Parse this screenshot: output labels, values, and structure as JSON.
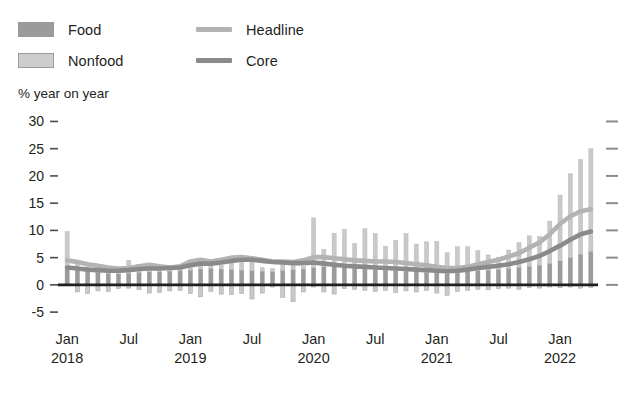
{
  "legend": {
    "items": [
      {
        "name": "food",
        "label": "Food",
        "type": "swatch",
        "color": "#9b9b9b"
      },
      {
        "name": "nonfood",
        "label": "Nonfood",
        "type": "swatch",
        "color": "#c9c9c9"
      },
      {
        "name": "headline",
        "label": "Headline",
        "type": "line",
        "color": "#b3b3b3"
      },
      {
        "name": "core",
        "label": "Core",
        "type": "line",
        "color": "#8a8a8a"
      }
    ]
  },
  "axis_title": "% year on year",
  "chart_data": {
    "type": "bar",
    "title": "",
    "subtitle": "",
    "xlabel": "",
    "ylabel": "% year on year",
    "ylim": [
      -7,
      31
    ],
    "yticks": [
      -5,
      0,
      5,
      10,
      15,
      20,
      25,
      30
    ],
    "ytick_labels": [
      "-5",
      "0",
      "5",
      "10",
      "15",
      "20",
      "25",
      "30"
    ],
    "right_axis_ticks": [
      0,
      5,
      10,
      15,
      20,
      25,
      30
    ],
    "grid": false,
    "legend_position": "top-left",
    "stacked": true,
    "zero_line": true,
    "x": [
      "Jan 2018",
      "Feb 2018",
      "Mar 2018",
      "Apr 2018",
      "May 2018",
      "Jun 2018",
      "Jul 2018",
      "Aug 2018",
      "Sep 2018",
      "Oct 2018",
      "Nov 2018",
      "Dec 2018",
      "Jan 2019",
      "Feb 2019",
      "Mar 2019",
      "Apr 2019",
      "May 2019",
      "Jun 2019",
      "Jul 2019",
      "Aug 2019",
      "Sep 2019",
      "Oct 2019",
      "Nov 2019",
      "Dec 2019",
      "Jan 2020",
      "Feb 2020",
      "Mar 2020",
      "Apr 2020",
      "May 2020",
      "Jun 2020",
      "Jul 2020",
      "Aug 2020",
      "Sep 2020",
      "Oct 2020",
      "Nov 2020",
      "Dec 2020",
      "Jan 2021",
      "Feb 2021",
      "Mar 2021",
      "Apr 2021",
      "May 2021",
      "Jun 2021",
      "Jul 2021",
      "Aug 2021",
      "Sep 2021",
      "Oct 2021",
      "Nov 2021",
      "Dec 2021",
      "Jan 2022",
      "Feb 2022",
      "Mar 2022",
      "Apr 2022"
    ],
    "xtick_labels": [
      {
        "label": "Jan",
        "year": "2018",
        "index": 0
      },
      {
        "label": "Jul",
        "year": "",
        "index": 6
      },
      {
        "label": "Jan",
        "year": "2019",
        "index": 12
      },
      {
        "label": "Jul",
        "year": "",
        "index": 18
      },
      {
        "label": "Jan",
        "year": "2020",
        "index": 24
      },
      {
        "label": "Jul",
        "year": "",
        "index": 30
      },
      {
        "label": "Jan",
        "year": "2021",
        "index": 36
      },
      {
        "label": "Jul",
        "year": "",
        "index": 42
      },
      {
        "label": "Jan",
        "year": "2022",
        "index": 48
      }
    ],
    "series": [
      {
        "name": "Food",
        "kind": "bar",
        "color": "#9b9b9b",
        "values": [
          3.2,
          2.6,
          2.4,
          2.3,
          2.1,
          2.0,
          2.1,
          2.3,
          2.4,
          2.4,
          2.5,
          2.6,
          2.7,
          2.9,
          3.0,
          2.9,
          2.8,
          2.7,
          2.6,
          2.5,
          2.4,
          2.6,
          2.8,
          2.9,
          3.1,
          3.3,
          3.3,
          3.2,
          3.0,
          2.9,
          2.8,
          2.7,
          2.6,
          2.5,
          2.4,
          2.3,
          2.2,
          2.1,
          2.2,
          2.4,
          2.6,
          2.7,
          2.8,
          3.0,
          3.2,
          3.4,
          3.6,
          3.9,
          4.4,
          5.0,
          5.6,
          6.1
        ]
      },
      {
        "name": "Nonfood",
        "kind": "bar",
        "color": "#c9c9c9",
        "values": [
          6.6,
          1.2,
          0.9,
          1.2,
          1.0,
          0.6,
          2.4,
          1.4,
          0.5,
          0.6,
          0.9,
          0.7,
          1.3,
          1.6,
          0.6,
          0.7,
          1.7,
          2.0,
          1.6,
          0.7,
          0.6,
          1.5,
          1.3,
          0.5,
          9.2,
          3.2,
          6.2,
          7.0,
          4.6,
          7.4,
          6.6,
          4.4,
          5.6,
          6.9,
          5.1,
          5.6,
          5.8,
          3.8,
          4.8,
          4.6,
          3.7,
          2.8,
          2.3,
          3.4,
          4.6,
          5.6,
          5.3,
          7.8,
          12.1,
          15.4,
          17.4,
          18.9
        ]
      },
      {
        "name": "Food (negative)",
        "kind": "bar-negative",
        "color": "#c9c9c9",
        "values": [
          0,
          -1.3,
          -1.6,
          -1.1,
          -1.2,
          -0.7,
          -0.6,
          -0.9,
          -1.5,
          -1.4,
          -1.1,
          -1.0,
          -1.6,
          -2.2,
          -1.2,
          -1.7,
          -1.8,
          -1.6,
          -2.6,
          -1.5,
          -0.4,
          -2.3,
          -3.1,
          -1.3,
          -0.4,
          -1.3,
          -1.7,
          -0.7,
          -0.8,
          -1.0,
          -1.2,
          -1.0,
          -1.4,
          -1.1,
          -1.3,
          -1.0,
          -1.5,
          -1.9,
          -1.2,
          -1.0,
          -0.8,
          -0.9,
          -0.7,
          -0.6,
          -0.8,
          -0.5,
          -0.6,
          -0.4,
          -0.5,
          -0.4,
          -0.6,
          -0.5
        ]
      },
      {
        "name": "Headline",
        "kind": "line",
        "color": "#b3b3b3",
        "values": [
          4.5,
          4.2,
          3.8,
          3.5,
          3.2,
          3.0,
          3.1,
          3.4,
          3.7,
          3.4,
          3.2,
          3.4,
          4.3,
          4.6,
          4.3,
          4.6,
          5.0,
          5.1,
          4.9,
          4.6,
          4.3,
          4.3,
          4.2,
          4.5,
          5.1,
          5.1,
          4.9,
          4.7,
          4.5,
          4.4,
          4.3,
          4.3,
          4.2,
          4.0,
          3.8,
          3.6,
          3.3,
          3.1,
          3.1,
          3.3,
          3.8,
          4.2,
          4.6,
          5.2,
          5.8,
          6.8,
          7.8,
          9.3,
          11.2,
          12.6,
          13.5,
          13.9
        ]
      },
      {
        "name": "Core",
        "kind": "line",
        "color": "#8a8a8a",
        "values": [
          3.2,
          3.0,
          2.8,
          2.7,
          2.6,
          2.6,
          2.7,
          2.9,
          3.0,
          3.0,
          3.1,
          3.2,
          3.6,
          3.9,
          3.9,
          4.1,
          4.4,
          4.6,
          4.6,
          4.4,
          4.2,
          4.1,
          4.0,
          4.0,
          4.1,
          3.9,
          3.7,
          3.5,
          3.4,
          3.3,
          3.2,
          3.1,
          3.0,
          2.9,
          2.8,
          2.7,
          2.6,
          2.5,
          2.6,
          2.8,
          3.1,
          3.3,
          3.5,
          3.8,
          4.2,
          4.7,
          5.3,
          6.2,
          7.2,
          8.3,
          9.3,
          9.8
        ]
      }
    ]
  }
}
